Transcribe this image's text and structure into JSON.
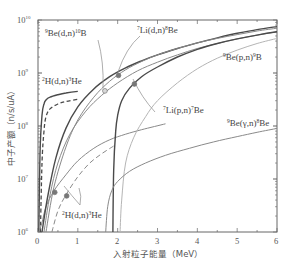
{
  "chart_data": {
    "type": "line",
    "title": "",
    "xlabel": "入射粒子能量（MeV）",
    "ylabel": "中子产额（n/s/uA）",
    "xlim": [
      0,
      6
    ],
    "ylim": [
      1000000.0,
      10000000000.0
    ],
    "yscale": "log",
    "x_ticks": [
      "0",
      "1",
      "2",
      "3",
      "4",
      "5",
      "6"
    ],
    "y_ticks": [
      {
        "base": "10",
        "exp": "6",
        "value": 1000000.0
      },
      {
        "base": "10",
        "exp": "7",
        "value": 10000000.0
      },
      {
        "base": "10",
        "exp": "8",
        "value": 100000000.0
      },
      {
        "base": "10",
        "exp": "9",
        "value": 1000000000.0
      },
      {
        "base": "10",
        "exp": "10",
        "value": 10000000000.0
      }
    ],
    "grid": false,
    "legend": "inline annotations",
    "series": [
      {
        "name": "2H(d,n)3He thick",
        "style": "solid-dark",
        "x": [
          0.02,
          0.05,
          0.1,
          0.15,
          0.2,
          0.3,
          0.5,
          0.7,
          1.0
        ],
        "y": [
          1000000.0,
          30000000.0,
          160000000.0,
          260000000.0,
          310000000.0,
          350000000.0,
          390000000.0,
          420000000.0,
          450000000.0
        ]
      },
      {
        "name": "2H(d,n)3He thick (dashed)",
        "style": "dashed-dark",
        "x": [
          0.06,
          0.1,
          0.15,
          0.2,
          0.3,
          0.5,
          0.7,
          1.0
        ],
        "y": [
          1000000.0,
          20000000.0,
          80000000.0,
          150000000.0,
          210000000.0,
          260000000.0,
          290000000.0,
          320000000.0
        ]
      },
      {
        "name": "2H(d,n)3He thin",
        "style": "solid-gray",
        "x": [
          0.02,
          0.1,
          0.2,
          0.4,
          0.7,
          1.0,
          1.4,
          1.8,
          2.2,
          2.6,
          3.2
        ],
        "y": [
          1000000.0,
          1500000.0,
          3000000.0,
          6000000.0,
          12000000.0,
          22000000.0,
          38000000.0,
          55000000.0,
          70000000.0,
          85000000.0,
          110000000.0
        ]
      },
      {
        "name": "2H(d,n)3He thin (dashed)",
        "style": "dashed-gray",
        "x": [
          0.35,
          0.5,
          0.7,
          1.0,
          1.3,
          1.6,
          1.9
        ],
        "y": [
          1000000.0,
          2500000.0,
          5000000.0,
          11000000.0,
          20000000.0,
          30000000.0,
          42000000.0
        ]
      },
      {
        "name": "9Be(d,n)10B",
        "style": "solid-gray",
        "x": [
          0.15,
          0.3,
          0.5,
          0.8,
          1.2,
          1.6,
          2.0,
          2.5,
          3.0,
          3.5,
          4.0,
          4.5,
          5.0,
          5.5,
          6.0
        ],
        "y": [
          1000000.0,
          5000000.0,
          20000000.0,
          70000000.0,
          190000000.0,
          380000000.0,
          650000000.0,
          1100000000.0,
          1600000000.0,
          2200000000.0,
          2900000000.0,
          3600000000.0,
          4400000000.0,
          5200000000.0,
          6000000000.0
        ]
      },
      {
        "name": "7Li(d,n)8Be",
        "style": "solid-dark",
        "x": [
          0.1,
          0.25,
          0.45,
          0.7,
          1.0,
          1.4,
          1.8,
          2.2,
          2.6,
          3.0,
          3.5,
          4.0,
          4.5,
          5.0,
          5.5,
          6.0
        ],
        "y": [
          1000000.0,
          5000000.0,
          25000000.0,
          90000000.0,
          230000000.0,
          500000000.0,
          850000000.0,
          1250000000.0,
          1700000000.0,
          2200000000.0,
          2900000000.0,
          3700000000.0,
          4600000000.0,
          5600000000.0,
          6600000000.0,
          7500000000.0
        ]
      },
      {
        "name": "7Li(d,n)8Be upper",
        "style": "solid-gray",
        "x": [
          0.2,
          0.4,
          0.7,
          1.0,
          1.4,
          1.8,
          2.2,
          2.6,
          3.0,
          3.5,
          4.0,
          4.5,
          5.0,
          5.5,
          6.0
        ],
        "y": [
          1000000.0,
          7000000.0,
          40000000.0,
          130000000.0,
          350000000.0,
          700000000.0,
          1150000000.0,
          1650000000.0,
          2200000000.0,
          2900000000.0,
          3700000000.0,
          4500000000.0,
          5300000000.0,
          6200000000.0,
          7000000000.0
        ]
      },
      {
        "name": "7Li(p,n)7Be",
        "style": "solid-dark",
        "x": [
          1.88,
          1.9,
          1.95,
          2.0,
          2.1,
          2.3,
          2.6,
          3.0,
          3.5,
          4.0,
          4.5,
          5.0,
          5.5,
          6.0
        ],
        "y": [
          1000000.0,
          15000000.0,
          80000000.0,
          160000000.0,
          300000000.0,
          520000000.0,
          850000000.0,
          1300000000.0,
          2000000000.0,
          2800000000.0,
          3600000000.0,
          4400000000.0,
          5200000000.0,
          6000000000.0
        ]
      },
      {
        "name": "9Be(p,n)9B",
        "style": "solid-light",
        "x": [
          2.06,
          2.1,
          2.2,
          2.4,
          2.7,
          3.0,
          3.5,
          4.0,
          4.5,
          5.0,
          5.5,
          6.0
        ],
        "y": [
          1000000.0,
          4000000.0,
          20000000.0,
          60000000.0,
          150000000.0,
          300000000.0,
          650000000.0,
          1200000000.0,
          1900000000.0,
          2700000000.0,
          3600000000.0,
          4500000000.0
        ]
      },
      {
        "name": "9Be(γ,n)8Be",
        "style": "solid-gray",
        "x": [
          1.7,
          1.75,
          1.85,
          2.0,
          2.3,
          2.7,
          3.2,
          3.8,
          4.4,
          5.0,
          5.5,
          6.0
        ],
        "y": [
          1000000.0,
          3000000.0,
          6000000.0,
          9000000.0,
          14000000.0,
          20000000.0,
          28000000.0,
          38000000.0,
          50000000.0,
          63000000.0,
          76000000.0,
          90000000.0
        ]
      }
    ],
    "markers": [
      {
        "series": "9Be(d,n)10B",
        "x": 1.68,
        "y": 460000000.0,
        "style": "hollow"
      },
      {
        "series": "7Li(d,n)8Be",
        "x": 2.02,
        "y": 900000000.0,
        "style": "filled"
      },
      {
        "series": "7Li(p,n)7Be",
        "x": 2.42,
        "y": 620000000.0,
        "style": "filled"
      },
      {
        "series": "2H(d,n)3He thin",
        "x": 0.42,
        "y": 5600000.0,
        "style": "filled"
      },
      {
        "series": "2H(d,n)3He thin (dashed)",
        "x": 0.72,
        "y": 4800000.0,
        "style": "filled"
      }
    ],
    "annotations": [
      {
        "id": "be_dn",
        "pre": "9",
        "main1": "Be(d,n)",
        "mid": "10",
        "main2": "B",
        "post": ""
      },
      {
        "id": "li_dn",
        "pre": "7",
        "main1": "Li(d,n)",
        "mid": "8",
        "main2": "Be",
        "post": ""
      },
      {
        "id": "h_dn_top",
        "pre": "2",
        "main1": "H(d,n)",
        "mid": "3",
        "main2": "He",
        "post": ""
      },
      {
        "id": "be_pn",
        "pre": "9",
        "main1": "Be(p,n)",
        "mid": "9",
        "main2": "B",
        "post": ""
      },
      {
        "id": "li_pn",
        "pre": "7",
        "main1": "Li(p,n)",
        "mid": "7",
        "main2": "Be",
        "post": ""
      },
      {
        "id": "be_gn",
        "pre": "9",
        "main1": "Be(γ,n)",
        "mid": "8",
        "main2": "Be",
        "post": ""
      },
      {
        "id": "h_dn_bot",
        "pre": "2",
        "main1": "H(d,n)",
        "mid": "3",
        "main2": "He",
        "post": ""
      }
    ]
  },
  "colors": {
    "axis": "#666666",
    "dark": "#4a4a4a",
    "gray": "#8a8a8a",
    "light": "#b5b5b5",
    "marker": "#777777",
    "leader": "#999999"
  }
}
